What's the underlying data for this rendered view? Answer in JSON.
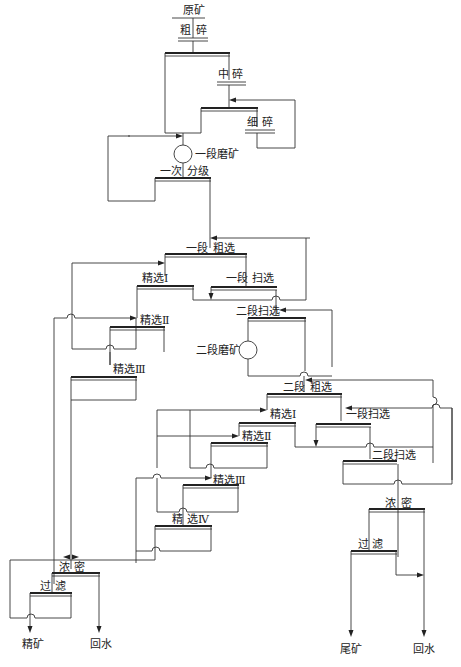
{
  "diagram": {
    "type": "mineral-processing-flowsheet",
    "nodes": {
      "raw_ore": "原矿",
      "coarse_crush": [
        "粗",
        "碎"
      ],
      "medium_crush": [
        "中",
        "碎"
      ],
      "fine_crush": [
        "细",
        "碎"
      ],
      "stage1_grinding": "一段磨矿",
      "primary_classify": [
        "一次",
        "分级"
      ],
      "stage1_rougher": [
        "一段",
        "粗选"
      ],
      "cleaner1_a": "精选Ⅰ",
      "stage1_scavenger": [
        "一段",
        "扫选"
      ],
      "cleaner2_a": "精选Ⅱ",
      "cleaner3_a": "精选Ⅲ",
      "stage2_scavenger_a": "二段扫选",
      "stage2_grinding": "二段磨矿",
      "stage2_rougher": [
        "二段",
        "粗选"
      ],
      "cleaner1_b": "精选Ⅰ",
      "stage1_scavenger_b": "一段扫选",
      "cleaner2_b": "精选Ⅱ",
      "stage2_scavenger_b": "二段扫选",
      "cleaner3_b": "精选Ⅲ",
      "cleaner4_b": [
        "精",
        "选Ⅳ"
      ],
      "thicken_left": [
        "浓",
        "密"
      ],
      "filter_left": [
        "过",
        "滤"
      ],
      "thicken_right": [
        "浓",
        "密"
      ],
      "filter_right": [
        "过",
        "滤"
      ],
      "product_concentrate": "精矿",
      "product_water_left": "回水",
      "product_tailings": "尾矿",
      "product_water_right": "回水"
    }
  }
}
